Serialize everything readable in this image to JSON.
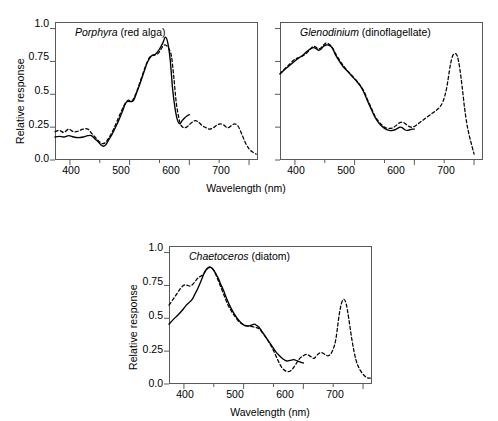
{
  "figure": {
    "axis_labels": {
      "x": "Wavelength (nm)",
      "y": "Relative response"
    },
    "x_ticks": [
      "400",
      "500",
      "600",
      "700"
    ],
    "y_ticks": [
      "0.0",
      "0.25",
      "0.5",
      "0.75",
      "1.0"
    ],
    "xlim": [
      375,
      715
    ],
    "ylim": [
      0,
      1.05
    ],
    "colors": {
      "axis": "#5a5a5a",
      "curve": "#000000"
    }
  },
  "panels": [
    {
      "id": "porphyra",
      "genus": "Porphyra",
      "common": " (red alga)"
    },
    {
      "id": "glenodinium",
      "genus": "Glenodinium",
      "common": " (dinoflagellate)"
    },
    {
      "id": "chaetoceros",
      "genus": "Chaetoceros",
      "common": " (diatom)"
    }
  ],
  "chart_data": [
    {
      "type": "line",
      "title": "Porphyra (red alga)",
      "xlabel": "Wavelength (nm)",
      "ylabel": "Relative response",
      "xlim": [
        375,
        715
      ],
      "ylim": [
        0,
        1.05
      ],
      "grid": false,
      "legend": null,
      "series": [
        {
          "name": "action spectrum",
          "style": "solid",
          "x": [
            375,
            382,
            390,
            398,
            406,
            414,
            422,
            430,
            436,
            442,
            448,
            452,
            456,
            460,
            464,
            470,
            476,
            482,
            488,
            492,
            496,
            500,
            506,
            512,
            518,
            524,
            530,
            536,
            542,
            548,
            552,
            556,
            560,
            564,
            568,
            572,
            576,
            580,
            584,
            588,
            592,
            596,
            600
          ],
          "y": [
            0.175,
            0.18,
            0.175,
            0.185,
            0.175,
            0.17,
            0.175,
            0.185,
            0.185,
            0.16,
            0.135,
            0.115,
            0.105,
            0.115,
            0.145,
            0.19,
            0.245,
            0.305,
            0.37,
            0.42,
            0.445,
            0.445,
            0.45,
            0.515,
            0.59,
            0.67,
            0.745,
            0.79,
            0.8,
            0.83,
            0.86,
            0.895,
            0.935,
            0.89,
            0.76,
            0.54,
            0.395,
            0.305,
            0.275,
            0.3,
            0.32,
            0.335,
            0.345
          ]
        },
        {
          "name": "absorption spectrum",
          "style": "dashed",
          "x": [
            375,
            382,
            390,
            398,
            406,
            414,
            422,
            430,
            436,
            442,
            448,
            454,
            460,
            466,
            472,
            478,
            484,
            490,
            494,
            498,
            504,
            510,
            516,
            522,
            528,
            534,
            540,
            546,
            550,
            554,
            558,
            562,
            566,
            570,
            574,
            578,
            582,
            586,
            592,
            598,
            604,
            610,
            616,
            622,
            628,
            634,
            640,
            646,
            652,
            658,
            664,
            670,
            676,
            682,
            688,
            694,
            700,
            706,
            712
          ],
          "y": [
            0.215,
            0.225,
            0.21,
            0.235,
            0.215,
            0.22,
            0.235,
            0.235,
            0.205,
            0.175,
            0.145,
            0.125,
            0.135,
            0.175,
            0.225,
            0.285,
            0.35,
            0.41,
            0.44,
            0.455,
            0.45,
            0.5,
            0.575,
            0.655,
            0.73,
            0.785,
            0.8,
            0.805,
            0.825,
            0.855,
            0.875,
            0.87,
            0.845,
            0.79,
            0.63,
            0.44,
            0.33,
            0.265,
            0.245,
            0.26,
            0.285,
            0.3,
            0.285,
            0.26,
            0.245,
            0.235,
            0.245,
            0.265,
            0.275,
            0.265,
            0.245,
            0.26,
            0.275,
            0.255,
            0.195,
            0.13,
            0.085,
            0.06,
            0.045
          ]
        }
      ]
    },
    {
      "type": "line",
      "title": "Glenodinium (dinoflagellate)",
      "xlabel": "Wavelength (nm)",
      "ylabel": "Relative response",
      "xlim": [
        375,
        715
      ],
      "ylim": [
        0,
        1.05
      ],
      "grid": false,
      "legend": null,
      "series": [
        {
          "name": "action spectrum",
          "style": "solid",
          "x": [
            375,
            382,
            390,
            398,
            406,
            414,
            420,
            426,
            432,
            436,
            440,
            444,
            448,
            452,
            456,
            460,
            464,
            468,
            474,
            480,
            486,
            492,
            498,
            504,
            510,
            516,
            522,
            528,
            534,
            540,
            546,
            552,
            558,
            564,
            570,
            576,
            580,
            584,
            588,
            592,
            596,
            600
          ],
          "y": [
            0.655,
            0.685,
            0.715,
            0.745,
            0.775,
            0.8,
            0.825,
            0.845,
            0.855,
            0.845,
            0.835,
            0.845,
            0.865,
            0.875,
            0.875,
            0.865,
            0.84,
            0.8,
            0.755,
            0.715,
            0.685,
            0.655,
            0.625,
            0.595,
            0.56,
            0.51,
            0.445,
            0.385,
            0.325,
            0.285,
            0.255,
            0.235,
            0.225,
            0.225,
            0.235,
            0.25,
            0.245,
            0.23,
            0.225,
            0.23,
            0.235,
            0.235
          ]
        },
        {
          "name": "absorption spectrum",
          "style": "dashed",
          "x": [
            375,
            382,
            390,
            398,
            404,
            410,
            416,
            422,
            428,
            432,
            436,
            440,
            444,
            448,
            452,
            456,
            460,
            464,
            468,
            474,
            480,
            486,
            492,
            498,
            504,
            510,
            516,
            522,
            528,
            534,
            540,
            546,
            552,
            558,
            564,
            570,
            576,
            582,
            588,
            594,
            600,
            606,
            612,
            618,
            624,
            630,
            636,
            642,
            648,
            654,
            660,
            664,
            668,
            672,
            676,
            680,
            684,
            688,
            692,
            696,
            700
          ],
          "y": [
            0.655,
            0.69,
            0.725,
            0.76,
            0.775,
            0.785,
            0.8,
            0.825,
            0.855,
            0.865,
            0.855,
            0.845,
            0.855,
            0.875,
            0.89,
            0.885,
            0.87,
            0.845,
            0.81,
            0.765,
            0.725,
            0.69,
            0.66,
            0.63,
            0.6,
            0.565,
            0.52,
            0.455,
            0.395,
            0.335,
            0.295,
            0.265,
            0.245,
            0.24,
            0.245,
            0.265,
            0.285,
            0.285,
            0.265,
            0.25,
            0.255,
            0.275,
            0.295,
            0.315,
            0.335,
            0.355,
            0.375,
            0.4,
            0.445,
            0.545,
            0.715,
            0.79,
            0.81,
            0.79,
            0.7,
            0.56,
            0.4,
            0.275,
            0.185,
            0.115,
            0.045
          ]
        }
      ]
    },
    {
      "type": "line",
      "title": "Chaetoceros (diatom)",
      "xlabel": "Wavelength (nm)",
      "ylabel": "Relative response",
      "xlim": [
        375,
        715
      ],
      "ylim": [
        0,
        1.05
      ],
      "grid": false,
      "legend": null,
      "series": [
        {
          "name": "action spectrum",
          "style": "solid",
          "x": [
            375,
            382,
            390,
            398,
            404,
            410,
            414,
            418,
            422,
            426,
            430,
            434,
            438,
            442,
            446,
            450,
            454,
            458,
            462,
            466,
            472,
            478,
            484,
            490,
            496,
            502,
            508,
            514,
            518,
            522,
            526,
            530,
            536,
            542,
            548,
            554,
            560,
            566,
            572,
            578,
            584,
            590,
            596,
            600
          ],
          "y": [
            0.455,
            0.49,
            0.525,
            0.565,
            0.6,
            0.625,
            0.645,
            0.68,
            0.715,
            0.755,
            0.8,
            0.845,
            0.875,
            0.89,
            0.885,
            0.865,
            0.835,
            0.8,
            0.755,
            0.715,
            0.645,
            0.585,
            0.535,
            0.495,
            0.465,
            0.445,
            0.44,
            0.45,
            0.455,
            0.445,
            0.43,
            0.405,
            0.365,
            0.325,
            0.285,
            0.245,
            0.215,
            0.19,
            0.175,
            0.18,
            0.185,
            0.175,
            0.165,
            0.16
          ]
        },
        {
          "name": "absorption spectrum",
          "style": "dashed",
          "x": [
            375,
            382,
            388,
            394,
            398,
            402,
            406,
            410,
            414,
            418,
            422,
            426,
            430,
            434,
            438,
            442,
            446,
            450,
            454,
            458,
            462,
            468,
            474,
            480,
            486,
            492,
            498,
            504,
            510,
            516,
            520,
            524,
            528,
            534,
            540,
            546,
            552,
            558,
            564,
            570,
            576,
            582,
            588,
            594,
            600,
            606,
            612,
            618,
            624,
            630,
            636,
            642,
            648,
            654,
            660,
            664,
            668,
            672,
            676,
            682,
            688,
            694,
            700,
            706,
            712
          ],
          "y": [
            0.6,
            0.645,
            0.685,
            0.725,
            0.745,
            0.755,
            0.75,
            0.745,
            0.755,
            0.775,
            0.8,
            0.815,
            0.825,
            0.845,
            0.87,
            0.885,
            0.885,
            0.865,
            0.825,
            0.78,
            0.735,
            0.665,
            0.6,
            0.55,
            0.51,
            0.475,
            0.455,
            0.445,
            0.44,
            0.435,
            0.43,
            0.425,
            0.41,
            0.375,
            0.335,
            0.29,
            0.235,
            0.175,
            0.125,
            0.1,
            0.095,
            0.115,
            0.155,
            0.195,
            0.215,
            0.225,
            0.21,
            0.195,
            0.225,
            0.24,
            0.225,
            0.215,
            0.245,
            0.33,
            0.525,
            0.615,
            0.645,
            0.605,
            0.5,
            0.32,
            0.185,
            0.115,
            0.075,
            0.05,
            0.045
          ]
        }
      ]
    }
  ]
}
